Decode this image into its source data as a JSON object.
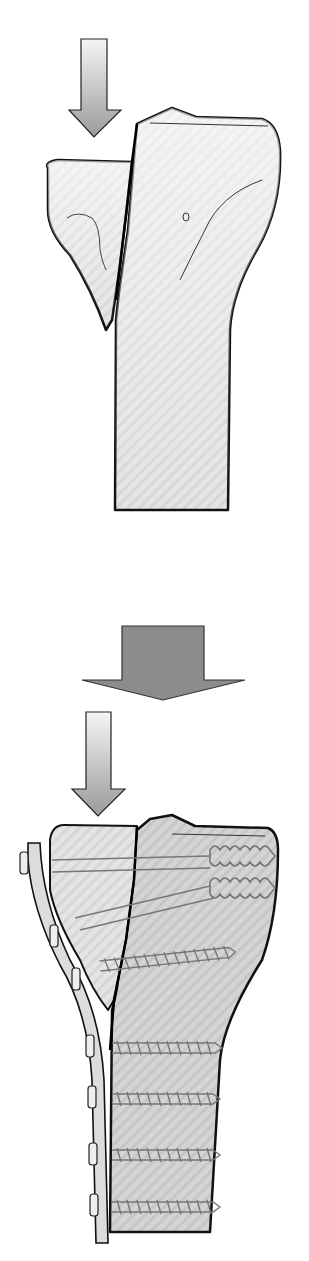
{
  "figure": {
    "title": "Tibial plateau split fracture and plate fixation",
    "panels": [
      {
        "id": "before",
        "description": "Lateral split fragment of proximal tibia displaced with axial load arrow"
      },
      {
        "id": "transition",
        "description": "Large downward arrow indicating progression to fixation"
      },
      {
        "id": "after",
        "description": "Fracture reduced and fixed with buttress plate, two lag screws and five cortical screws"
      }
    ],
    "colors": {
      "bone_fill": "#e6e6e6",
      "bone_fill_dark": "#cfcfcf",
      "outline": "#111111",
      "arrow_light": "#f2f2f2",
      "arrow_dark": "#9a9a9a",
      "big_arrow": "#8c8c8c",
      "screw": "#7a7a7a",
      "plate": "#dcdcdc"
    },
    "counts": {
      "lag_screws": 2,
      "cortical_screws": 5,
      "plate_heads": 6
    }
  }
}
